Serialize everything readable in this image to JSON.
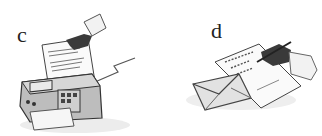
{
  "panels": [
    {
      "label": "c",
      "illustration": "fax-machine-icon",
      "description": "A hand feeds a document into a fax machine"
    },
    {
      "label": "d",
      "illustration": "letter-writing-icon",
      "description": "A hand writes a letter with a pen next to an envelope"
    }
  ],
  "colors": {
    "background": "#ffffff",
    "ink": "#333333",
    "shade": "#9a9a9a",
    "light": "#e6e6e6"
  }
}
